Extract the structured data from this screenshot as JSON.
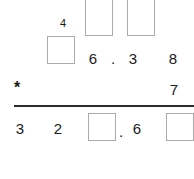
{
  "problem": {
    "type": "long-multiplication-worksheet",
    "operator": "*",
    "multiplicand": {
      "visible_digits": [
        "6",
        ".",
        "3",
        "8"
      ],
      "hidden_digit_boxes": 1
    },
    "multiplier": {
      "visible_digits": [
        "7"
      ]
    },
    "carry_row": {
      "visible_digits": [
        "4"
      ],
      "hidden_digit_boxes": 2
    },
    "result": {
      "visible_digits": [
        "3",
        "2",
        ".",
        "6"
      ],
      "hidden_digit_boxes": 2
    }
  },
  "carry_row": {
    "digit_4": "4",
    "box_1": "",
    "box_2": "",
    "box_3": ""
  },
  "operand_row": {
    "digit_6": "6",
    "decimal_point": ".",
    "digit_3": "3",
    "digit_8": "8"
  },
  "multiplier_row": {
    "operator": "*",
    "digit_7": "7"
  },
  "result_row": {
    "digit_3": "3",
    "digit_2": "2",
    "box_1": "",
    "decimal_point": ".",
    "digit_6": "6",
    "box_2": ""
  },
  "colors": {
    "background": "#ffffff",
    "ink": "#1a1a1a",
    "box_border": "#aaaaaa",
    "rule": "#2a2a2a"
  }
}
